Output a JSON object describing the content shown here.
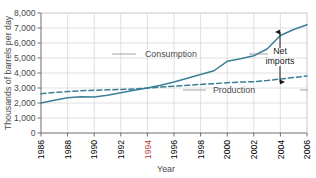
{
  "chart_data": {
    "type": "line",
    "title": "",
    "xlabel": "Year",
    "ylabel": "Thousands of barrels per day",
    "xlim": [
      1986,
      2006
    ],
    "ylim": [
      0,
      8000
    ],
    "grid": true,
    "legend_position": "inline-annotations",
    "accent_color": "#3b7f96",
    "xticks": [
      1986,
      1988,
      1990,
      1992,
      1994,
      1996,
      1998,
      2000,
      2002,
      2004,
      2006
    ],
    "xtick_labels": [
      "1986",
      "1988",
      "1990",
      "1992",
      "1994",
      "1996",
      "1998",
      "2000",
      "2002",
      "2004",
      "2006"
    ],
    "xtick_highlight": "1994",
    "yticks": [
      0,
      1000,
      2000,
      3000,
      4000,
      5000,
      6000,
      7000,
      8000
    ],
    "ytick_labels": [
      "0",
      "1,000",
      "2,000",
      "3,000",
      "4,000",
      "5,000",
      "6,000",
      "7,000",
      "8,000"
    ],
    "x": [
      1986,
      1987,
      1988,
      1989,
      1990,
      1991,
      1992,
      1993,
      1994,
      1995,
      1996,
      1997,
      1998,
      1999,
      2000,
      2001,
      2002,
      2003,
      2004,
      2005,
      2006
    ],
    "series": [
      {
        "name": "Consumption",
        "style": "solid",
        "color": "#3b7f96",
        "values": [
          2000,
          2180,
          2350,
          2420,
          2400,
          2520,
          2680,
          2850,
          3000,
          3180,
          3400,
          3650,
          3900,
          4150,
          4780,
          4950,
          5150,
          5600,
          6500,
          6900,
          7220
        ]
      },
      {
        "name": "Production",
        "style": "dashed",
        "color": "#3b7f96",
        "values": [
          2620,
          2700,
          2760,
          2820,
          2850,
          2880,
          2900,
          2940,
          3000,
          3060,
          3120,
          3180,
          3240,
          3290,
          3350,
          3400,
          3420,
          3500,
          3600,
          3700,
          3800
        ]
      }
    ],
    "annotations": [
      {
        "name": "Net imports",
        "label_lines": [
          "Net",
          "imports"
        ],
        "type": "double-arrow",
        "at_year": 2005,
        "from_value": 3700,
        "to_value": 6900
      }
    ],
    "series_labels": [
      {
        "text": "Consumption",
        "leader": true
      },
      {
        "text": "Production",
        "leader": true
      }
    ]
  }
}
